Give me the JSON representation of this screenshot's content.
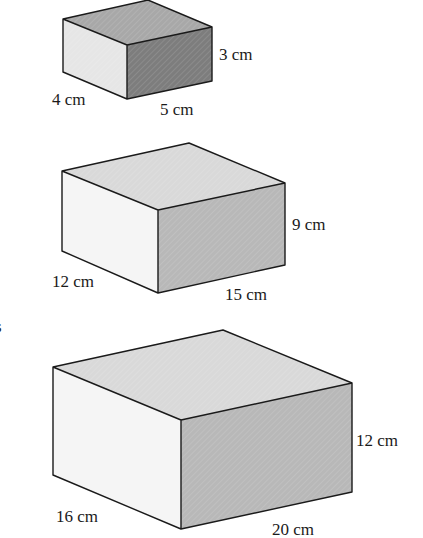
{
  "diagram": {
    "type": "cuboids",
    "colors": {
      "small_top": "#a8a8a8",
      "small_left": "#e6e6e6",
      "small_front": "#7d7d7d",
      "top": "#d9d9d9",
      "left": "#f5f5f5",
      "front": "#b8b8b8",
      "edge": "#1a1a1a"
    },
    "boxes": [
      {
        "id": "box-1",
        "depth": "4 cm",
        "width": "5 cm",
        "height": "3 cm"
      },
      {
        "id": "box-2",
        "depth": "12 cm",
        "width": "15 cm",
        "height": "9 cm"
      },
      {
        "id": "box-3",
        "depth": "16 cm",
        "width": "20 cm",
        "height": "12 cm"
      }
    ],
    "margin_fragment": "s"
  }
}
